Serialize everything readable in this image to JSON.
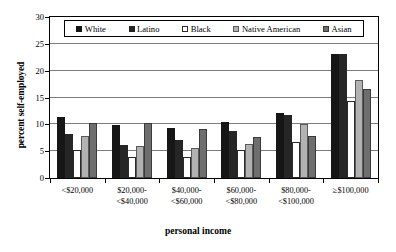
{
  "chart_data": {
    "type": "bar",
    "title": "",
    "xlabel": "personal income",
    "ylabel": "percent self-employed",
    "ylim": [
      0,
      30
    ],
    "yticks": [
      0,
      5,
      10,
      15,
      20,
      25,
      30
    ],
    "grid": true,
    "legend_position": "top-inside",
    "categories": [
      "<$20,000",
      "$20,000-\n<$40,000",
      "$40,000-\n<$60,000",
      "$60,000-\n<$80,000",
      "$80,000-\n<$100,000",
      "≥$100,000"
    ],
    "category_lines": [
      [
        "<$20,000",
        ""
      ],
      [
        "$20,000-",
        "<$40,000"
      ],
      [
        "$40,000-",
        "<$60,000"
      ],
      [
        "$60,000-",
        "<$80,000"
      ],
      [
        "$80,000-",
        "<$100,000"
      ],
      [
        "≥$100,000",
        ""
      ]
    ],
    "series": [
      {
        "name": "White",
        "color": "#161616",
        "values": [
          11.3,
          9.8,
          9.3,
          10.4,
          12.2,
          23.1
        ]
      },
      {
        "name": "Latino",
        "color": "#262626",
        "values": [
          8.2,
          6.1,
          7.1,
          8.7,
          11.7,
          23.2
        ]
      },
      {
        "name": "Black",
        "color": "#ffffff",
        "values": [
          5.3,
          4.0,
          4.0,
          5.2,
          6.8,
          14.4
        ]
      },
      {
        "name": "Native American",
        "color": "#b2b2b2",
        "values": [
          7.9,
          5.9,
          5.6,
          6.4,
          10.0,
          18.3
        ]
      },
      {
        "name": "Asian",
        "color": "#6e6e6e",
        "values": [
          10.2,
          10.2,
          9.2,
          7.7,
          7.9,
          16.5
        ]
      }
    ]
  }
}
